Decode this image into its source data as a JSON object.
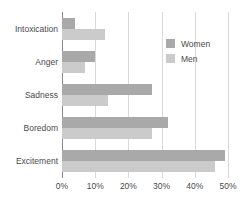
{
  "chart_data": {
    "type": "bar",
    "orientation": "horizontal",
    "title": "",
    "subtitle": "",
    "xlabel": "",
    "ylabel": "",
    "categories": [
      "Intoxication",
      "Anger",
      "Sadness",
      "Boredom",
      "Excitement"
    ],
    "series": [
      {
        "name": "Women",
        "color": "#a9a9a9",
        "values": [
          4,
          10,
          27,
          32,
          49
        ]
      },
      {
        "name": "Men",
        "color": "#cbcbcb",
        "values": [
          13,
          7,
          14,
          27,
          46
        ]
      }
    ],
    "xlim": [
      0,
      50
    ],
    "xticks": [
      0,
      10,
      20,
      30,
      40,
      50
    ],
    "xtick_labels": [
      "0%",
      "10%",
      "20%",
      "30%",
      "40%",
      "50%"
    ],
    "grid": true,
    "grid_axis": "x",
    "legend_position": "upper right",
    "legend_entries": [
      "Women",
      "Men"
    ],
    "value_suffix": "%"
  },
  "colors": {
    "women": "#a9a9a9",
    "men": "#cbcbcb",
    "gridline": "#d9d9d9",
    "axis": "#8a8a8a",
    "text": "#4a4a4a",
    "background": "#ffffff"
  }
}
